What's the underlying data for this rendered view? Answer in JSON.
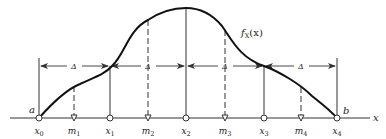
{
  "figure": {
    "curve_label": "f",
    "curve_label_sub": "X",
    "curve_label_arg": "(x)",
    "axis_label": "x",
    "endpoint_left": "a",
    "endpoint_right": "b",
    "interval_label": "Δ",
    "points": [
      {
        "name": "x",
        "sub": "0",
        "kind": "boundary"
      },
      {
        "name": "m",
        "sub": "1",
        "kind": "midpoint"
      },
      {
        "name": "x",
        "sub": "1",
        "kind": "boundary"
      },
      {
        "name": "m",
        "sub": "2",
        "kind": "midpoint"
      },
      {
        "name": "x",
        "sub": "2",
        "kind": "boundary"
      },
      {
        "name": "m",
        "sub": "3",
        "kind": "midpoint"
      },
      {
        "name": "x",
        "sub": "3",
        "kind": "boundary"
      },
      {
        "name": "m",
        "sub": "4",
        "kind": "midpoint"
      },
      {
        "name": "x",
        "sub": "4",
        "kind": "boundary"
      }
    ],
    "colors": {
      "ink": "#1a1a1a",
      "background": "#ffffff"
    }
  }
}
